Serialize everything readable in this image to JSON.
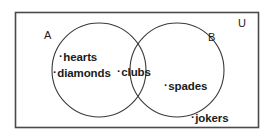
{
  "diagram": {
    "type": "venn",
    "title": "",
    "universe_label": "U",
    "sets": [
      {
        "id": "A",
        "label": "A",
        "members": [
          "hearts",
          "diamonds"
        ]
      },
      {
        "id": "B",
        "label": "B",
        "members": [
          "spades"
        ]
      }
    ],
    "intersection": {
      "label": "A ∩ B",
      "members": [
        "clubs"
      ]
    },
    "outside": {
      "label": "U only",
      "members": [
        "jokers"
      ]
    },
    "elements": [
      {
        "name": "hearts",
        "region": "A-only",
        "bullet": "·",
        "text": "hearts"
      },
      {
        "name": "diamonds",
        "region": "A-only",
        "bullet": "·",
        "text": "diamonds"
      },
      {
        "name": "clubs",
        "region": "A-intersect-B",
        "bullet": "·",
        "text": "clubs"
      },
      {
        "name": "spades",
        "region": "B-only",
        "bullet": "·",
        "text": "spades"
      },
      {
        "name": "jokers",
        "region": "outside",
        "bullet": "·",
        "text": "jokers"
      }
    ],
    "colors": {
      "stroke": "#3a3a3a",
      "universe_border": "#4a4a4a",
      "background": "#ffffff",
      "text": "#1b1b1b"
    }
  }
}
